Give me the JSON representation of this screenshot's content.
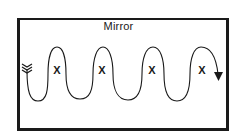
{
  "diagram": {
    "title": "Mirror",
    "markers": [
      {
        "label": "X",
        "x": 57,
        "y": 64
      },
      {
        "label": "X",
        "x": 102,
        "y": 64
      },
      {
        "label": "X",
        "x": 152,
        "y": 64
      },
      {
        "label": "X",
        "x": 202,
        "y": 64
      }
    ],
    "path": {
      "start": "fletching-left",
      "end": "arrowhead-down-right",
      "shape": "serpentine-wave"
    },
    "colors": {
      "ink": "#1a1a1a",
      "background": "#ffffff"
    }
  }
}
